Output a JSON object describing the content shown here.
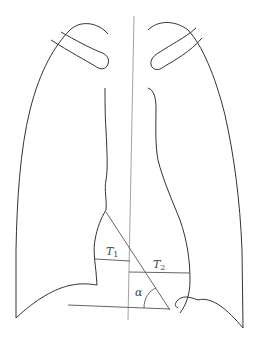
{
  "diagram": {
    "labels": {
      "t1": "T",
      "t1_sub": "1",
      "t2": "T",
      "t2_sub": "2",
      "alpha": "α"
    },
    "colors": {
      "outline": "#333333",
      "measure": "#555555",
      "midline": "#888888",
      "background": "#ffffff"
    }
  }
}
